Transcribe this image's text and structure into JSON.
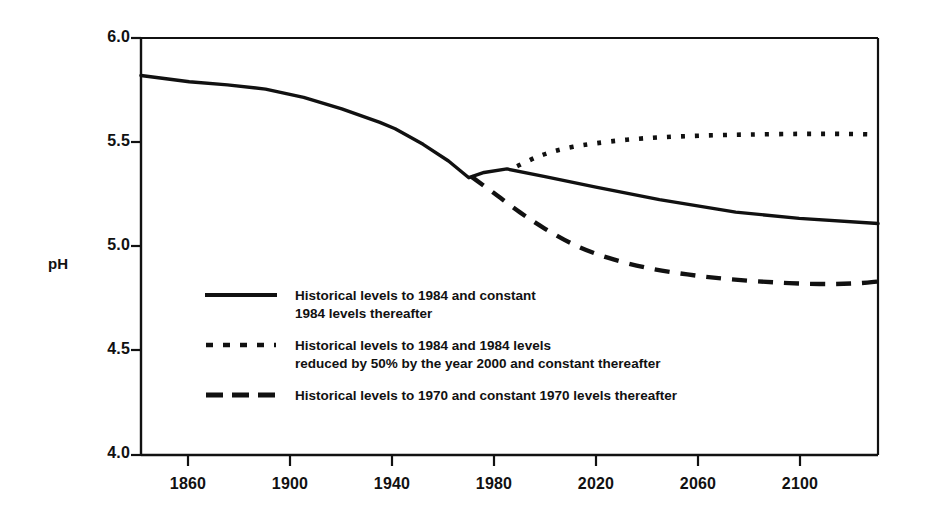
{
  "chart_data": {
    "type": "line",
    "title": "",
    "xlabel": "",
    "ylabel": "pH",
    "xlim": [
      1841,
      2131
    ],
    "ylim": [
      4.0,
      6.0
    ],
    "grid": false,
    "legend_position": "inside-lower-left",
    "xticks": [
      "1860",
      "1900",
      "1940",
      "1980",
      "2020",
      "2060",
      "2100"
    ],
    "xtick_values": [
      1860,
      1900,
      1940,
      1980,
      2020,
      2060,
      2100
    ],
    "yticks": [
      "6.0",
      "5.5",
      "5.0",
      "4.5",
      "4.0"
    ],
    "ytick_values": [
      6.0,
      5.5,
      5.0,
      4.5,
      4.0
    ],
    "series": [
      {
        "name": "Historical levels to 1984 and constant\n1984 levels thereafter",
        "style": "solid",
        "x": [
          1841,
          1860,
          1875,
          1890,
          1905,
          1920,
          1935,
          1941,
          1952,
          1962,
          1970,
          1976,
          1985,
          2000,
          2020,
          2045,
          2075,
          2100,
          2131
        ],
        "y": [
          5.82,
          5.79,
          5.775,
          5.755,
          5.715,
          5.66,
          5.595,
          5.565,
          5.49,
          5.41,
          5.33,
          5.355,
          5.372,
          5.335,
          5.285,
          5.225,
          5.165,
          5.135,
          5.11
        ]
      },
      {
        "name": "Historical levels to 1984 and 1984 levels\nreduced by 50% by the year 2000 and constant thereafter",
        "style": "dotted",
        "x": [
          1989,
          1996,
          2003,
          2011,
          2020,
          2032,
          2046,
          2062,
          2080,
          2100,
          2118,
          2131
        ],
        "y": [
          5.385,
          5.425,
          5.455,
          5.478,
          5.495,
          5.512,
          5.524,
          5.532,
          5.537,
          5.54,
          5.54,
          5.537
        ]
      },
      {
        "name": "Historical levels to 1970 and constant 1970 levels thereafter",
        "style": "dashed",
        "x": [
          1971,
          1980,
          1990,
          2000,
          2012,
          2025,
          2040,
          2056,
          2072,
          2090,
          2108,
          2122,
          2131
        ],
        "y": [
          5.335,
          5.255,
          5.165,
          5.085,
          5.005,
          4.945,
          4.898,
          4.866,
          4.844,
          4.828,
          4.82,
          4.823,
          4.832
        ]
      }
    ]
  },
  "axis": {
    "y_label": "pH",
    "y_tick_labels": [
      "6.0",
      "5.5",
      "5.0",
      "4.5",
      "4.0"
    ],
    "x_tick_labels": [
      "1860",
      "1900",
      "1940",
      "1980",
      "2020",
      "2060",
      "2100"
    ]
  },
  "legend": {
    "entries": [
      {
        "marker": "solid-line",
        "label": "Historical levels to 1984 and constant\n1984 levels thereafter"
      },
      {
        "marker": "dotted-line",
        "label": "Historical levels to 1984 and 1984 levels\nreduced by 50% by the year 2000 and constant thereafter"
      },
      {
        "marker": "dashed-line",
        "label": "Historical levels to 1970 and constant 1970 levels thereafter"
      }
    ]
  },
  "colors": {
    "ink": "#111111",
    "background": "#ffffff"
  }
}
